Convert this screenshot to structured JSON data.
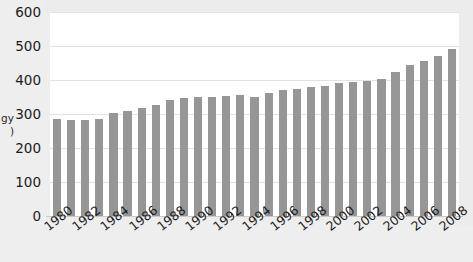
{
  "chart_data": {
    "type": "bar",
    "title": "",
    "xlabel": "",
    "ylabel": "gy\n)",
    "ylabel_note": "y-axis label is cropped at the left edge of the image; only the fragments \"gy\" and \")\" are visible",
    "ylim": [
      0,
      600
    ],
    "yticks": [
      0,
      100,
      200,
      300,
      400,
      500,
      600
    ],
    "ytick_labels": [
      "0",
      "100",
      "200",
      "300",
      "400",
      "500",
      "600"
    ],
    "grid": true,
    "legend": false,
    "bar_color": "#969696",
    "plot_background": "#ffffff",
    "figure_background": "#ececec",
    "categories": [
      "1980",
      "1981",
      "1982",
      "1983",
      "1984",
      "1985",
      "1986",
      "1987",
      "1988",
      "1989",
      "1990",
      "1991",
      "1992",
      "1993",
      "1994",
      "1995",
      "1996",
      "1997",
      "1998",
      "1999",
      "2000",
      "2001",
      "2002",
      "2003",
      "2004",
      "2005",
      "2006",
      "2007",
      "2008"
    ],
    "xtick_labels": [
      "1980",
      "1982",
      "1984",
      "1986",
      "1988",
      "1990",
      "1992",
      "1994",
      "1996",
      "1998",
      "2000",
      "2002",
      "2004",
      "2006",
      "2008"
    ],
    "values": [
      285,
      283,
      283,
      285,
      303,
      310,
      318,
      327,
      340,
      347,
      350,
      351,
      354,
      357,
      350,
      362,
      370,
      375,
      380,
      382,
      391,
      395,
      396,
      404,
      425,
      444,
      456,
      472,
      491
    ]
  }
}
